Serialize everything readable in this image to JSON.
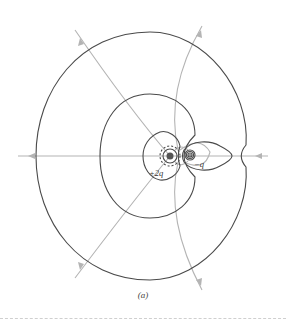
{
  "figure": {
    "caption": "(a)",
    "charges": [
      {
        "label": "+2q",
        "sign": "positive",
        "x": 170,
        "y": 156
      },
      {
        "label": "−q",
        "sign": "negative",
        "x": 190,
        "y": 155
      }
    ],
    "colors": {
      "equipotential": "#4a4a4a",
      "field_line": "#b4b4b4",
      "positive_charge": "#555555",
      "negative_charge": "#777777"
    },
    "legend": {
      "equipotential_name": "equipotential-surfaces",
      "field_line_name": "electric-field-lines"
    }
  }
}
